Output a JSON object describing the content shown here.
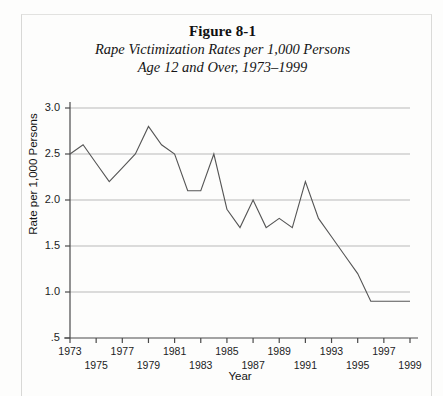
{
  "figure": {
    "number_label": "Figure 8-1",
    "subtitle_line1": "Rape Victimization Rates per 1,000 Persons",
    "subtitle_line2": "Age 12 and Over, 1973–1999"
  },
  "axes": {
    "y_title": "Rate per 1,000 Persons",
    "x_title": "Year",
    "y_ticks": [
      "3.0",
      "2.5",
      "2.0",
      "1.5",
      "1.0",
      ".5"
    ],
    "x_ticks": [
      "1973",
      "1975",
      "1977",
      "1979",
      "1981",
      "1983",
      "1985",
      "1987",
      "1989",
      "1991",
      "1993",
      "1995",
      "1997",
      "1999"
    ]
  },
  "colors": {
    "line": "#555555",
    "grid": "#b9b9b9",
    "axis": "#4a4a4a",
    "background": "#fdfdfc",
    "text": "#1a1a1a"
  },
  "chart_data": {
    "type": "line",
    "title": "Rape Victimization Rates per 1,000 Persons Age 12 and Over, 1973–1999",
    "xlabel": "Year",
    "ylabel": "Rate per 1,000 Persons",
    "xlim": [
      1973,
      1999
    ],
    "ylim": [
      0.5,
      3.0
    ],
    "ytick_values": [
      3.0,
      2.5,
      2.0,
      1.5,
      1.0,
      0.5
    ],
    "xtick_values": [
      1973,
      1975,
      1977,
      1979,
      1981,
      1983,
      1985,
      1987,
      1989,
      1991,
      1993,
      1995,
      1997,
      1999
    ],
    "grid": "horizontal",
    "legend": "none",
    "x": [
      1973,
      1974,
      1975,
      1976,
      1977,
      1978,
      1979,
      1980,
      1981,
      1982,
      1983,
      1984,
      1985,
      1986,
      1987,
      1988,
      1989,
      1990,
      1991,
      1992,
      1993,
      1994,
      1995,
      1996,
      1997,
      1998,
      1999
    ],
    "values": [
      2.5,
      2.6,
      2.4,
      2.2,
      2.35,
      2.5,
      2.8,
      2.6,
      2.5,
      2.1,
      2.1,
      2.5,
      1.9,
      1.7,
      2.0,
      1.7,
      1.8,
      1.7,
      2.2,
      1.8,
      1.6,
      1.4,
      1.2,
      0.9,
      0.9,
      0.9,
      0.9
    ]
  }
}
